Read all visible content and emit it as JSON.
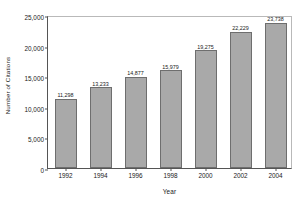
{
  "chart_data": {
    "type": "bar",
    "title": "",
    "xlabel": "Year",
    "ylabel": "Number of Citations",
    "categories": [
      "1992",
      "1994",
      "1996",
      "1998",
      "2000",
      "2002",
      "2004"
    ],
    "values": [
      11298,
      13233,
      14877,
      15979,
      19275,
      22229,
      23738
    ],
    "value_labels": [
      "11,298",
      "13,233",
      "14,877",
      "15,979",
      "19,275",
      "22,229",
      "23,738"
    ],
    "ylim": [
      0,
      25000
    ],
    "yticks": [
      0,
      5000,
      10000,
      15000,
      20000,
      25000
    ],
    "ytick_labels": [
      "0",
      "5,000",
      "10,000",
      "15,000",
      "20,000",
      "25,000"
    ],
    "grid": false,
    "legend": "none",
    "series": [
      {
        "name": "Number of Citations",
        "values": [
          11298,
          13233,
          14877,
          15979,
          19275,
          22229,
          23738
        ]
      }
    ],
    "colors": {
      "bar_fill": "#a9a9a9",
      "bar_border": "#6e6e6e",
      "axis": "#555555",
      "text": "#1a1a1a",
      "background": "#ffffff"
    }
  }
}
